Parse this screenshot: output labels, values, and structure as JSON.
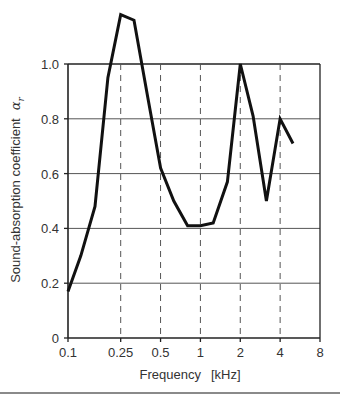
{
  "chart_data": {
    "type": "line",
    "title": "",
    "xlabel": "Frequency",
    "xlabel_unit": "[kHz]",
    "ylabel": "Sound-absorption coefficient",
    "ylabel_symbol": "α",
    "ylabel_subscript": "r",
    "x_scale": "log",
    "xlim": [
      0.1,
      8
    ],
    "ylim": [
      0,
      1.0
    ],
    "x_ticks": [
      0.1,
      0.25,
      0.5,
      1,
      2,
      4,
      8
    ],
    "x_tick_labels": [
      "0.1",
      "0.25",
      "0.5",
      "1",
      "2",
      "4",
      "8"
    ],
    "x_dashed_gridlines": [
      0.25,
      0.5,
      1,
      2,
      4
    ],
    "y_ticks": [
      0,
      0.2,
      0.4,
      0.6,
      0.8,
      1.0
    ],
    "y_tick_labels": [
      "0",
      "0.2",
      "0.4",
      "0.6",
      "0.8",
      "1.0"
    ],
    "grid": true,
    "legend": null,
    "x": [
      0.1,
      0.125,
      0.16,
      0.2,
      0.25,
      0.315,
      0.4,
      0.5,
      0.63,
      0.8,
      1.0,
      1.25,
      1.6,
      2.0,
      2.5,
      3.15,
      4.0,
      5.0
    ],
    "series": [
      {
        "name": "Sound-absorption coefficient",
        "values": [
          0.17,
          0.3,
          0.48,
          0.95,
          1.18,
          1.16,
          0.88,
          0.62,
          0.5,
          0.41,
          0.41,
          0.42,
          0.57,
          1.0,
          0.81,
          0.5,
          0.8,
          0.71
        ]
      }
    ]
  },
  "colors": {
    "line": "#111111",
    "axis": "#222222",
    "grid_solid": "#555555",
    "grid_dashed": "#555555",
    "bottom_rule": "#8a8a8a"
  }
}
